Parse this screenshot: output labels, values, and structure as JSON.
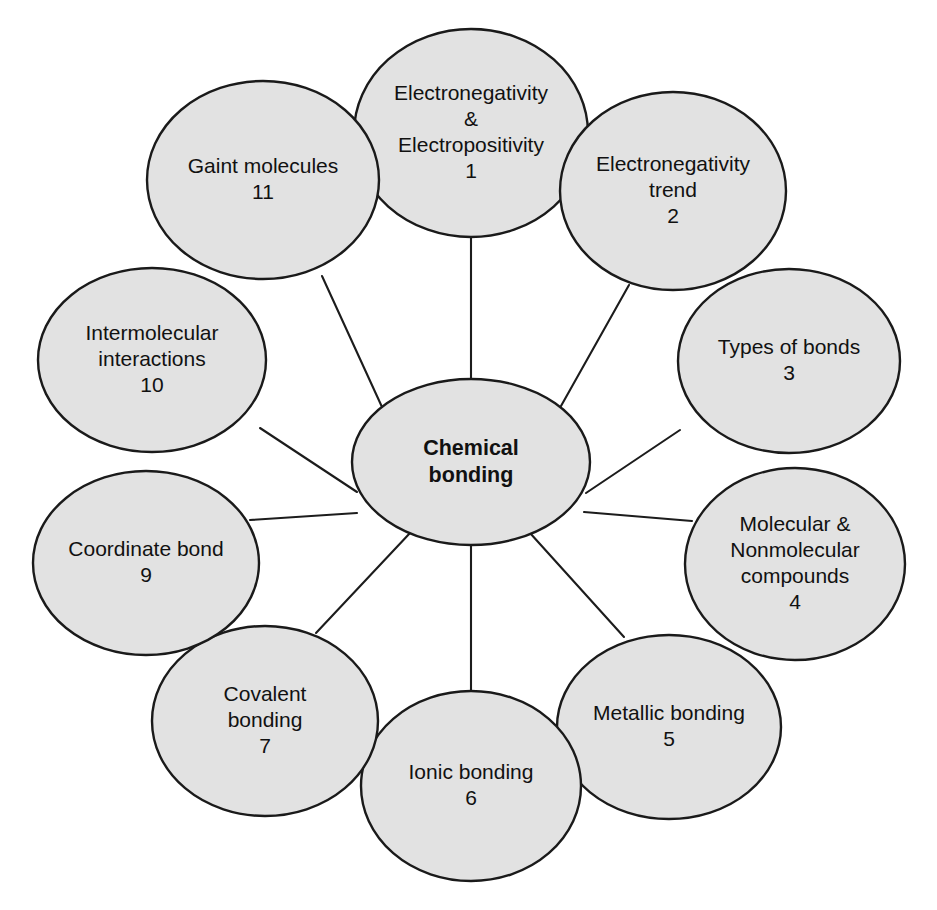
{
  "diagram": {
    "type": "radial-concept-map",
    "background_color": "#ffffff",
    "node_fill_color": "#e2e2e2",
    "node_stroke_color": "#1a1a1a",
    "edge_color": "#1c1c1c",
    "center": {
      "id": "center",
      "lines": [
        "Chemical",
        "bonding"
      ],
      "number": "",
      "cx": 471,
      "cy": 462,
      "rx": 119,
      "ry": 83,
      "bold": true
    },
    "nodes": [
      {
        "id": "node-1",
        "lines": [
          "Electronegativity",
          "&",
          "Electropositivity"
        ],
        "number": "1",
        "cx": 471,
        "cy": 133,
        "rx": 117,
        "ry": 104
      },
      {
        "id": "node-2",
        "lines": [
          "Electronegativity",
          "trend"
        ],
        "number": "2",
        "cx": 673,
        "cy": 191,
        "rx": 113,
        "ry": 99
      },
      {
        "id": "node-3",
        "lines": [
          "Types of bonds"
        ],
        "number": "3",
        "cx": 789,
        "cy": 361,
        "rx": 111,
        "ry": 92
      },
      {
        "id": "node-4",
        "lines": [
          "Molecular &",
          "Nonmolecular",
          "compounds"
        ],
        "number": "4",
        "cx": 795,
        "cy": 564,
        "rx": 110,
        "ry": 96
      },
      {
        "id": "node-5",
        "lines": [
          "Metallic bonding"
        ],
        "number": "5",
        "cx": 669,
        "cy": 727,
        "rx": 112,
        "ry": 92
      },
      {
        "id": "node-6",
        "lines": [
          "Ionic bonding"
        ],
        "number": "6",
        "cx": 471,
        "cy": 786,
        "rx": 110,
        "ry": 95
      },
      {
        "id": "node-7",
        "lines": [
          "Covalent",
          "bonding"
        ],
        "number": "7",
        "cx": 265,
        "cy": 721,
        "rx": 113,
        "ry": 95
      },
      {
        "id": "node-9",
        "lines": [
          "Coordinate bond"
        ],
        "number": "9",
        "cx": 146,
        "cy": 563,
        "rx": 113,
        "ry": 92
      },
      {
        "id": "node-10",
        "lines": [
          "Intermolecular",
          "interactions"
        ],
        "number": "10",
        "cx": 152,
        "cy": 360,
        "rx": 114,
        "ry": 92
      },
      {
        "id": "node-11",
        "lines": [
          "Gaint molecules"
        ],
        "number": "11",
        "cx": 263,
        "cy": 180,
        "rx": 116,
        "ry": 99
      }
    ],
    "edges": [
      {
        "id": "edge-center-1",
        "from": "center",
        "to": "node-1",
        "x1": 471,
        "y1": 379,
        "x2": 471,
        "y2": 238
      },
      {
        "id": "edge-center-2",
        "from": "center",
        "to": "node-2",
        "x1": 561,
        "y1": 406,
        "x2": 629,
        "y2": 285
      },
      {
        "id": "edge-center-3",
        "from": "center",
        "to": "node-3",
        "x1": 586,
        "y1": 493,
        "x2": 680,
        "y2": 430
      },
      {
        "id": "edge-center-4",
        "from": "center",
        "to": "node-4",
        "x1": 584,
        "y1": 512,
        "x2": 692,
        "y2": 521
      },
      {
        "id": "edge-center-5",
        "from": "center",
        "to": "node-5",
        "x1": 530,
        "y1": 533,
        "x2": 624,
        "y2": 637
      },
      {
        "id": "edge-center-6",
        "from": "center",
        "to": "node-6",
        "x1": 471,
        "y1": 544,
        "x2": 471,
        "y2": 692
      },
      {
        "id": "edge-center-7",
        "from": "center",
        "to": "node-7",
        "x1": 410,
        "y1": 533,
        "x2": 316,
        "y2": 633
      },
      {
        "id": "edge-center-9",
        "from": "center",
        "to": "node-9",
        "x1": 357,
        "y1": 513,
        "x2": 250,
        "y2": 520
      },
      {
        "id": "edge-center-10",
        "from": "center",
        "to": "node-10",
        "x1": 357,
        "y1": 492,
        "x2": 260,
        "y2": 428
      },
      {
        "id": "edge-center-11",
        "from": "center",
        "to": "node-11",
        "x1": 382,
        "y1": 407,
        "x2": 322,
        "y2": 276
      }
    ]
  }
}
